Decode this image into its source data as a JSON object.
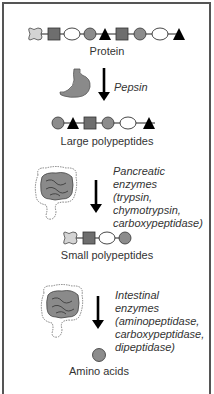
{
  "stages": [
    {
      "label": "Protein",
      "chain": [
        "bone",
        "square",
        "oval",
        "circle",
        "triangle",
        "square",
        "circle",
        "oval",
        "triangle"
      ]
    },
    {
      "label": "Large polypeptides",
      "chain": [
        "circle",
        "triangle",
        "square",
        "circle",
        "oval",
        "triangle"
      ]
    },
    {
      "label": "Small polypeptides",
      "chain": [
        "bone",
        "square",
        "oval",
        "circle"
      ]
    },
    {
      "label": "Amino acids",
      "chain": [
        "circle"
      ]
    }
  ],
  "steps": [
    {
      "organ": "stomach-icon",
      "enzyme_lines": [
        "Pepsin"
      ]
    },
    {
      "organ": "intestine-icon",
      "enzyme_lines": [
        "Pancreatic",
        "enzymes",
        "(trypsin,",
        "chymotrypsin,",
        "carboxypeptidase)"
      ]
    },
    {
      "organ": "intestine-icon",
      "enzyme_lines": [
        "Intestinal",
        "enzymes",
        "(aminopeptidase,",
        "carboxypeptidase,",
        "dipeptidase)"
      ]
    }
  ],
  "colors": {
    "square": "#6e6e6e",
    "circle": "#8c8c8c",
    "oval": "#ffffff",
    "triangle": "#000000",
    "bone": "#d4d4d4",
    "organ": "#8a8a8a",
    "arrow": "#000000",
    "frame": "#555555"
  }
}
